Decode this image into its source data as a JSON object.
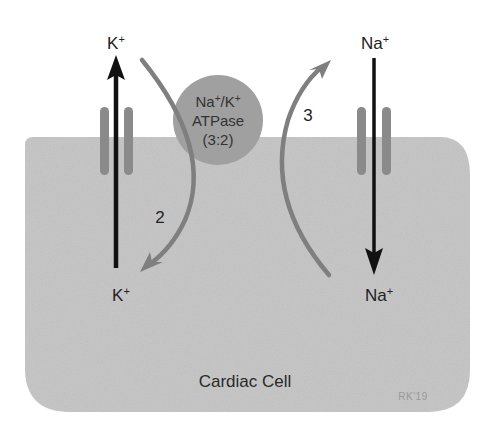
{
  "diagram": {
    "cell_label": "Cardiac Cell",
    "signature": "RK'19",
    "pump": {
      "line1_a": "Na",
      "line1_sup_a": "+",
      "line1_sep": "/K",
      "line1_sup_b": "+",
      "line2": "ATPase",
      "line3": "(3:2)"
    },
    "ions": {
      "k_out": {
        "symbol": "K",
        "charge": "+"
      },
      "k_in": {
        "symbol": "K",
        "charge": "+"
      },
      "na_out": {
        "symbol": "Na",
        "charge": "+"
      },
      "na_in": {
        "symbol": "Na",
        "charge": "+"
      }
    },
    "stoichiometry": {
      "k_count": "2",
      "na_count": "3"
    },
    "colors": {
      "cell_fill": "#c4c4c4",
      "channel": "#8a8a8a",
      "pump_fill": "#a0a0a0",
      "pump_arrow": "#7f7f7f",
      "ion_arrow": "#111111"
    }
  }
}
